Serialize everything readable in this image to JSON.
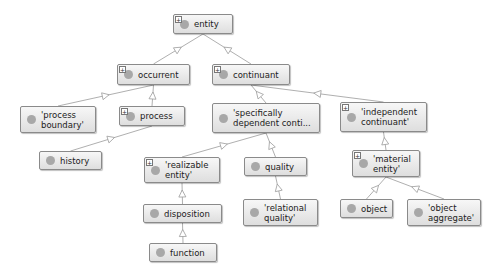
{
  "diagram": {
    "type": "class-hierarchy-graph",
    "colors": {
      "node_border": "#8a8a8a",
      "node_fill_top": "#f7f7f7",
      "node_fill_bottom": "#dedede",
      "dot": "#a8a8a8",
      "edge": "#9a9a9a"
    },
    "nodes": [
      {
        "id": "entity",
        "label": "entity",
        "expandable": true,
        "x": 173,
        "y": 14,
        "w": 60,
        "h": 20
      },
      {
        "id": "occurrent",
        "label": "occurrent",
        "expandable": true,
        "x": 117,
        "y": 64,
        "w": 73,
        "h": 21
      },
      {
        "id": "continuant",
        "label": "continuant",
        "expandable": true,
        "x": 212,
        "y": 64,
        "w": 78,
        "h": 21
      },
      {
        "id": "process_boundary",
        "label": "'process\nboundary'",
        "expandable": false,
        "x": 20,
        "y": 106,
        "w": 76,
        "h": 27
      },
      {
        "id": "process",
        "label": "process",
        "expandable": true,
        "x": 119,
        "y": 106,
        "w": 66,
        "h": 20
      },
      {
        "id": "specifically_dependent",
        "label": "'specifically\ndependent conti...",
        "expandable": false,
        "x": 212,
        "y": 103,
        "w": 108,
        "h": 30
      },
      {
        "id": "independent_continuant",
        "label": "'independent\ncontinuant'",
        "expandable": true,
        "x": 340,
        "y": 102,
        "w": 87,
        "h": 30
      },
      {
        "id": "history",
        "label": "history",
        "expandable": false,
        "x": 39,
        "y": 151,
        "w": 63,
        "h": 19
      },
      {
        "id": "realizable_entity",
        "label": "'realizable\nentity'",
        "expandable": true,
        "x": 144,
        "y": 157,
        "w": 76,
        "h": 26
      },
      {
        "id": "quality",
        "label": "quality",
        "expandable": false,
        "x": 244,
        "y": 157,
        "w": 63,
        "h": 19
      },
      {
        "id": "material_entity",
        "label": "'material\nentity'",
        "expandable": true,
        "x": 352,
        "y": 150,
        "w": 68,
        "h": 27
      },
      {
        "id": "disposition",
        "label": "disposition",
        "expandable": false,
        "x": 143,
        "y": 204,
        "w": 79,
        "h": 19
      },
      {
        "id": "relational_quality",
        "label": "'relational\nquality'",
        "expandable": false,
        "x": 243,
        "y": 199,
        "w": 75,
        "h": 27
      },
      {
        "id": "object",
        "label": "object",
        "expandable": false,
        "x": 340,
        "y": 199,
        "w": 53,
        "h": 19
      },
      {
        "id": "object_aggregate",
        "label": "'object\naggregate'",
        "expandable": false,
        "x": 407,
        "y": 199,
        "w": 74,
        "h": 27
      },
      {
        "id": "function",
        "label": "function",
        "expandable": false,
        "x": 149,
        "y": 243,
        "w": 68,
        "h": 19
      }
    ],
    "edges": [
      {
        "from": "occurrent",
        "to": "entity"
      },
      {
        "from": "continuant",
        "to": "entity"
      },
      {
        "from": "process_boundary",
        "to": "occurrent"
      },
      {
        "from": "process",
        "to": "occurrent"
      },
      {
        "from": "specifically_dependent",
        "to": "continuant"
      },
      {
        "from": "independent_continuant",
        "to": "continuant"
      },
      {
        "from": "history",
        "to": "process"
      },
      {
        "from": "realizable_entity",
        "to": "specifically_dependent"
      },
      {
        "from": "quality",
        "to": "specifically_dependent"
      },
      {
        "from": "material_entity",
        "to": "independent_continuant"
      },
      {
        "from": "disposition",
        "to": "realizable_entity"
      },
      {
        "from": "relational_quality",
        "to": "quality"
      },
      {
        "from": "object",
        "to": "material_entity"
      },
      {
        "from": "object_aggregate",
        "to": "material_entity"
      },
      {
        "from": "function",
        "to": "disposition"
      }
    ]
  }
}
